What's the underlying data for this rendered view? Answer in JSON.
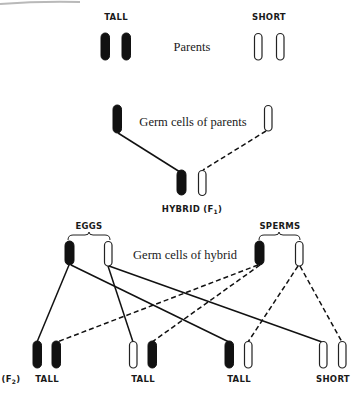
{
  "diagram": {
    "type": "mendelian-inheritance-cross",
    "labels": {
      "parent_tall": "TALL",
      "parent_short": "SHORT",
      "parents": "Parents",
      "germ_cells_parents": "Germ cells of parents",
      "hybrid": "HYBRID (F",
      "hybrid_sub": "1",
      "hybrid_close": ")",
      "eggs": "EGGS",
      "sperms": "SPERMS",
      "germ_cells_hybrid": "Germ cells of hybrid",
      "f2": "(F",
      "f2_sub": "2",
      "f2_close": ")"
    },
    "f2_offspring": [
      {
        "label": "TALL",
        "chromosomes": [
          "dominant",
          "dominant"
        ]
      },
      {
        "label": "TALL",
        "chromosomes": [
          "recessive",
          "dominant"
        ]
      },
      {
        "label": "TALL",
        "chromosomes": [
          "dominant",
          "recessive"
        ]
      },
      {
        "label": "SHORT",
        "chromosomes": [
          "recessive",
          "recessive"
        ]
      }
    ],
    "legend": {
      "dominant_fill": "#111111",
      "recessive_fill": "#ffffff",
      "egg_lines": "solid",
      "sperm_lines": "dashed"
    }
  }
}
